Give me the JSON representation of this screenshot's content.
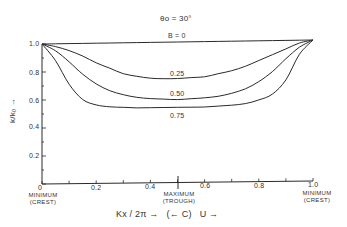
{
  "chart_data": {
    "type": "line",
    "title": "θo = 30°",
    "xlabel": "Kx / 2π →   (← C)   U →",
    "ylabel": "k/k₀ →",
    "xlim": [
      0,
      1.0
    ],
    "ylim": [
      0,
      1.0
    ],
    "grid": false,
    "x_ticks": [
      0,
      0.2,
      0.4,
      0.6,
      0.8,
      1.0
    ],
    "x_tick_labels": [
      "0",
      "0.2",
      "0.4",
      "0.6",
      "0.8",
      "1.0"
    ],
    "y_ticks": [
      0,
      0.2,
      0.4,
      0.6,
      0.8,
      1.0
    ],
    "y_tick_labels": [
      "0",
      "0.2",
      "0.4",
      "0.6",
      "0.8",
      "1.0"
    ],
    "x_annotations": [
      {
        "x": 0,
        "text": "MINIMUM\n(CREST)"
      },
      {
        "x": 0.5,
        "text": "MAXIMUM\n(TROUGH)"
      },
      {
        "x": 1.0,
        "text": "MINIMUM\n(CREST)"
      }
    ],
    "x": [
      0,
      0.05,
      0.1,
      0.15,
      0.2,
      0.25,
      0.3,
      0.35,
      0.4,
      0.45,
      0.5,
      0.55,
      0.6,
      0.65,
      0.7,
      0.75,
      0.8,
      0.85,
      0.9,
      0.95,
      1.0
    ],
    "series": [
      {
        "name": "B = 0",
        "label": "B=0",
        "values": [
          1.0,
          1.0,
          1.0,
          1.0,
          1.0,
          1.0,
          1.0,
          1.0,
          1.0,
          1.0,
          1.0,
          1.0,
          1.0,
          1.0,
          1.0,
          1.0,
          1.0,
          1.0,
          1.0,
          1.0,
          1.0
        ]
      },
      {
        "name": "B = 0.25",
        "label": "0.25",
        "values": [
          1.0,
          0.98,
          0.95,
          0.91,
          0.86,
          0.82,
          0.78,
          0.76,
          0.745,
          0.74,
          0.74,
          0.745,
          0.75,
          0.77,
          0.79,
          0.82,
          0.86,
          0.9,
          0.94,
          0.98,
          1.0
        ]
      },
      {
        "name": "B = 0.50",
        "label": "0.50",
        "values": [
          1.0,
          0.95,
          0.87,
          0.78,
          0.71,
          0.66,
          0.63,
          0.61,
          0.6,
          0.595,
          0.59,
          0.595,
          0.6,
          0.61,
          0.63,
          0.66,
          0.71,
          0.78,
          0.87,
          0.95,
          1.0
        ]
      },
      {
        "name": "B = 0.75",
        "label": "0.75",
        "values": [
          1.0,
          0.88,
          0.71,
          0.6,
          0.56,
          0.545,
          0.54,
          0.535,
          0.535,
          0.535,
          0.535,
          0.535,
          0.535,
          0.54,
          0.545,
          0.555,
          0.58,
          0.62,
          0.72,
          0.9,
          1.0
        ]
      }
    ]
  },
  "labels": {
    "title": "θo = 30°",
    "series_b0": "B = 0",
    "series_025": "0.25",
    "series_050": "0.50",
    "series_075": "0.75",
    "y_axis": "k/k₀ →",
    "x_caption": "Kx / 2π →   (← C)   U →",
    "min_crest_left_1": "MINIMUM",
    "min_crest_left_2": "(CREST)",
    "max_trough_1": "MAXIMUM",
    "max_trough_2": "(TROUGH)",
    "min_crest_right_1": "MINIMUM",
    "min_crest_right_2": "(CREST)",
    "xt0": "0",
    "xt1": "0.2",
    "xt2": "0.4",
    "xt3": "0.6",
    "xt4": "0.8",
    "xt5": "1.0",
    "yt1": "0.2",
    "yt2": "0.4",
    "yt3": "0.6",
    "yt4": "0.8",
    "yt5": "1.0"
  },
  "colors": {
    "line": "#2a2a2a",
    "background": "#ffffff"
  }
}
